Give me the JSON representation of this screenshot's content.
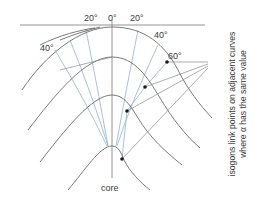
{
  "figure": {
    "labels": {
      "angle_20_left": "20°",
      "angle_0": "0°",
      "angle_20_right": "20°",
      "angle_40_left": "40°",
      "angle_40_right": "40°",
      "angle_60": "60°",
      "core": "core"
    },
    "caption_line1": "isogons link points on adjacent curves",
    "caption_line2": "where α has the same value",
    "colors": {
      "fold_curves": "#6b6b6b",
      "isogons": "#8fb2d6",
      "tangents": "#8a8a8a",
      "dots": "#1a1a1a"
    },
    "elements": {
      "fold_curves": 4,
      "dip_isogons_per_side": 3,
      "marked_points_alpha": "60°",
      "marked_points_count": 4
    }
  }
}
